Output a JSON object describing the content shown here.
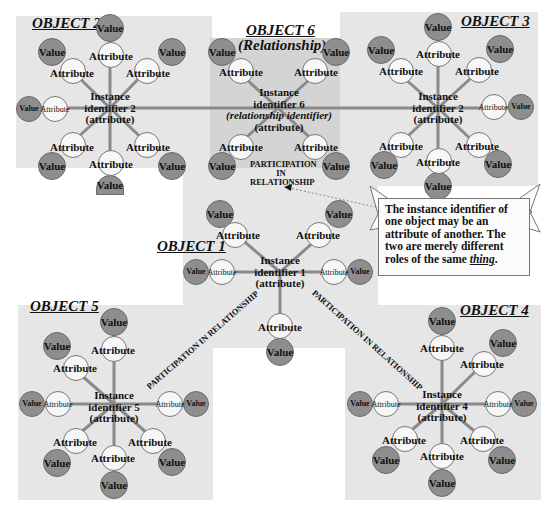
{
  "objects": [
    {
      "id": "obj2",
      "title": "OBJECT 2",
      "center": [
        "Instance",
        "identifier 2",
        "(attribute)"
      ]
    },
    {
      "id": "obj6",
      "title": "OBJECT 6",
      "subtitle": "(Relationship)",
      "center": [
        "Instance",
        "identifier 6",
        "(relationship identifier)",
        "(attribute)"
      ]
    },
    {
      "id": "obj3",
      "title": "OBJECT 3",
      "center": [
        "Instance",
        "identifier 2",
        "(attribute)"
      ]
    },
    {
      "id": "obj1",
      "title": "OBJECT 1",
      "center": [
        "Instance",
        "identifier 1",
        "(attribute)"
      ]
    },
    {
      "id": "obj5",
      "title": "OBJECT 5",
      "center": [
        "Instance",
        "identifier 5",
        "(attribute)"
      ]
    },
    {
      "id": "obj4",
      "title": "OBJECT 4",
      "center": [
        "Instance",
        "identifier 4",
        "(attribute)"
      ]
    }
  ],
  "labels": {
    "attribute": "Attribute",
    "value": "Value",
    "participation_stacked": [
      "PARTICIPATION",
      "IN",
      "RELATIONSHIP"
    ],
    "participation_line": "PARTICIPATION IN RELATIONSHIP"
  },
  "callout": {
    "text_before": "The instance identifier of one object may be an attribute of another. The two are merely different roles of the same ",
    "emphasis": "thing",
    "text_after": "."
  },
  "colors": {
    "region_bg": "#e6e6e6",
    "relationship_bg": "#d4d4d4",
    "value_fill": "#8e8e8e",
    "attribute_fill": "#f7f7f7",
    "connector": "#8a8a8a"
  }
}
